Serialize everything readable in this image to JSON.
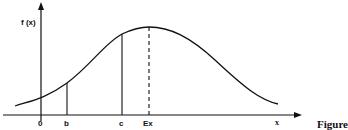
{
  "diagram": {
    "y_axis_label": "f (x)",
    "x_axis_label": "x",
    "tick_labels": {
      "origin": "0",
      "b": "b",
      "c": "c",
      "ex": "Ex"
    },
    "caption": "Figure",
    "curve": "bell-shaped density f(x), peak at Ex",
    "markers": [
      {
        "label": "b",
        "style": "solid"
      },
      {
        "label": "c",
        "style": "solid"
      },
      {
        "label": "Ex",
        "style": "dashed"
      }
    ],
    "colors": {
      "line": "#111111",
      "background": "#ffffff"
    }
  }
}
